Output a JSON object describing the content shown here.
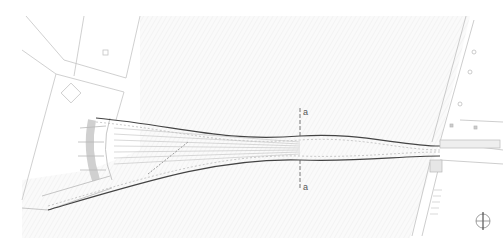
{
  "drawing": {
    "type": "site plan",
    "subject": "pedestrian bridge",
    "section_marks": [
      {
        "label": "a",
        "position": "top"
      },
      {
        "label": "a",
        "position": "bottom"
      }
    ],
    "north_arrow": "north-arrow-icon"
  },
  "colors": {
    "background": "#ffffff",
    "line_dark": "#555555",
    "line_light": "#b8b8b8",
    "hatch": "#ececec"
  }
}
